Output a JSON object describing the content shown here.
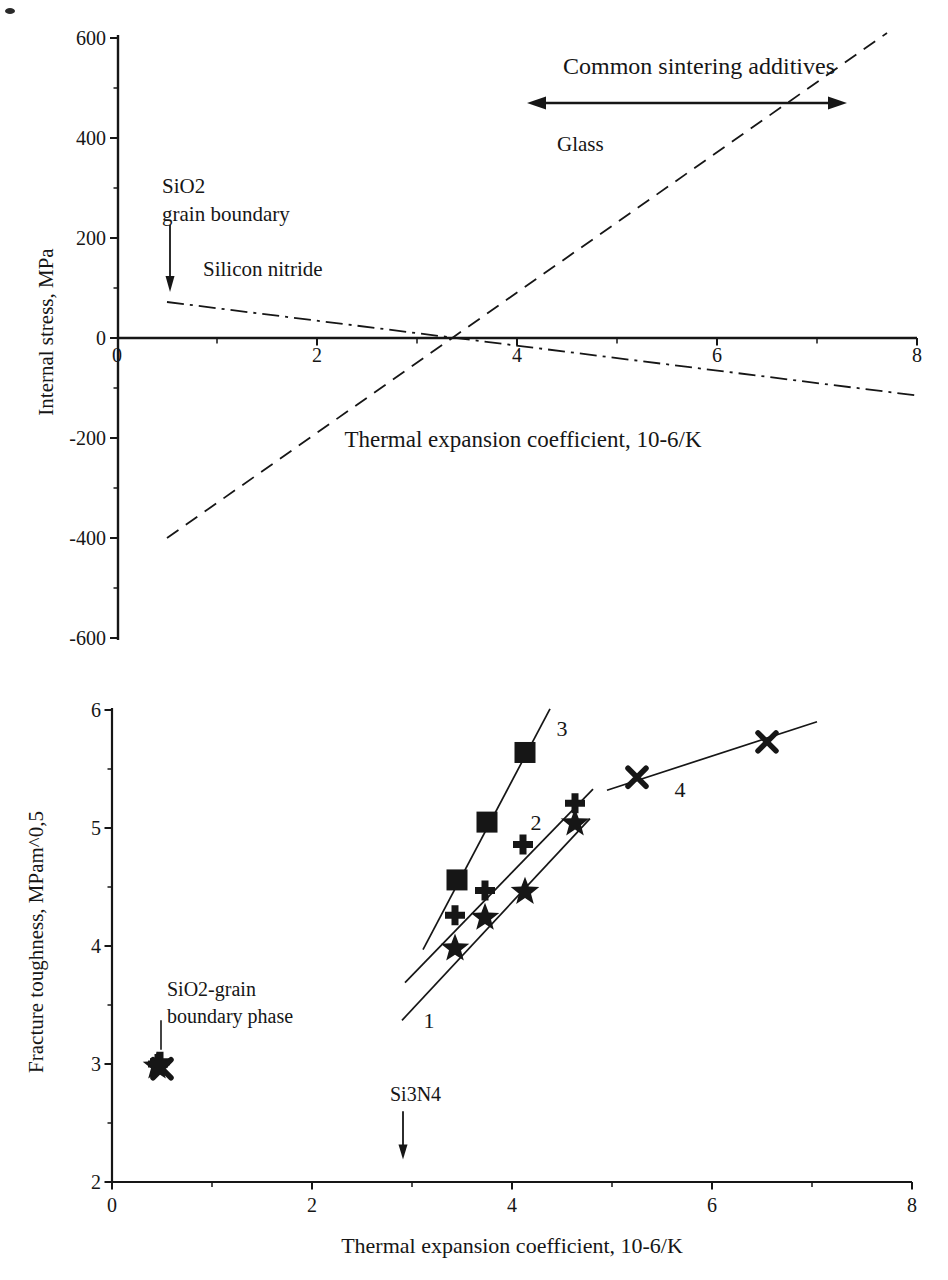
{
  "figure": {
    "background": "#ffffff",
    "ink_color": "#161616"
  },
  "chart_data": [
    {
      "id": "internal-stress-chart",
      "type": "line",
      "title": "",
      "xlabel": "Thermal expansion coefficient, 10-6/K",
      "ylabel": "Internal stress, MPa",
      "xlim": [
        0,
        8
      ],
      "ylim": [
        -600,
        600
      ],
      "x_ticks": [
        0,
        2,
        4,
        6,
        8
      ],
      "y_ticks": [
        600,
        400,
        200,
        0,
        -200,
        -400,
        -600
      ],
      "grid": false,
      "series": [
        {
          "name": "Glass",
          "line_style": "dashed",
          "marker": "none",
          "points": [
            [
              0.5,
              -400
            ],
            [
              7.7,
              610
            ]
          ]
        },
        {
          "name": "Silicon nitride",
          "line_style": "dashdot",
          "marker": "none",
          "points": [
            [
              0.5,
              72
            ],
            [
              8.0,
              -115
            ]
          ]
        }
      ],
      "annotations": {
        "common_additives_label": "Common sintering additives",
        "common_additives_span": {
          "x1": 4.1,
          "x2": 7.3,
          "y": 470
        },
        "glass_label": "Glass",
        "sio2_label_line1": "SiO2",
        "sio2_label_line2": "grain boundary",
        "sio2_arrow": {
          "x": 0.53,
          "y1": 226,
          "y2": 92
        },
        "silicon_nitride_label": "Silicon nitride"
      }
    },
    {
      "id": "fracture-toughness-chart",
      "type": "scatter",
      "title": "",
      "xlabel": "Thermal expansion coefficient, 10-6/K",
      "ylabel": "Fracture toughness, MPam^0,5",
      "xlim": [
        0,
        8
      ],
      "ylim": [
        2,
        6
      ],
      "x_ticks": [
        0,
        2,
        4,
        6,
        8
      ],
      "y_ticks": [
        6,
        5,
        4,
        3,
        2
      ],
      "grid": false,
      "series": [
        {
          "name": "1",
          "marker": "star",
          "points": [
            [
              3.43,
              3.98
            ],
            [
              3.73,
              4.24
            ],
            [
              4.13,
              4.46
            ],
            [
              4.63,
              5.04
            ]
          ],
          "fit_line": [
            [
              2.9,
              3.37
            ],
            [
              4.78,
              5.08
            ]
          ],
          "label_pos": [
            3.17,
            3.37
          ]
        },
        {
          "name": "2",
          "marker": "plus",
          "points": [
            [
              3.43,
              4.26
            ],
            [
              3.73,
              4.47
            ],
            [
              4.11,
              4.86
            ],
            [
              4.63,
              5.21
            ]
          ],
          "fit_line": [
            [
              2.93,
              3.69
            ],
            [
              4.81,
              5.33
            ]
          ],
          "label_pos": [
            4.24,
            5.05
          ]
        },
        {
          "name": "3",
          "marker": "square",
          "points": [
            [
              3.45,
              4.56
            ],
            [
              3.75,
              5.05
            ],
            [
              4.13,
              5.64
            ]
          ],
          "fit_line": [
            [
              3.11,
              3.97
            ],
            [
              4.38,
              6.01
            ]
          ],
          "label_pos": [
            4.5,
            5.85
          ]
        },
        {
          "name": "4",
          "marker": "x",
          "points": [
            [
              5.25,
              5.43
            ],
            [
              6.55,
              5.73
            ]
          ],
          "fit_line": [
            [
              4.95,
              5.32
            ],
            [
              7.05,
              5.9
            ]
          ],
          "label_pos": [
            5.68,
            5.33
          ]
        }
      ],
      "cluster": {
        "description": "overlapping markers at SiO2 grain boundary phase",
        "markers": [
          {
            "type": "star",
            "x": 0.45,
            "y": 2.98
          },
          {
            "type": "plus",
            "x": 0.48,
            "y": 3.02
          },
          {
            "type": "x",
            "x": 0.5,
            "y": 2.96
          },
          {
            "type": "plus",
            "x": 0.46,
            "y": 3.0
          }
        ]
      },
      "annotations": {
        "sio2_label_line1": "SiO2-grain",
        "sio2_label_line2": "boundary phase",
        "sio2_leader": {
          "x": 0.49,
          "y1": 3.37,
          "y2": 3.12
        },
        "si3n4_label": "Si3N4",
        "si3n4_arrow": {
          "x": 2.91,
          "y1": 2.6,
          "y2": 2.19
        }
      }
    }
  ]
}
